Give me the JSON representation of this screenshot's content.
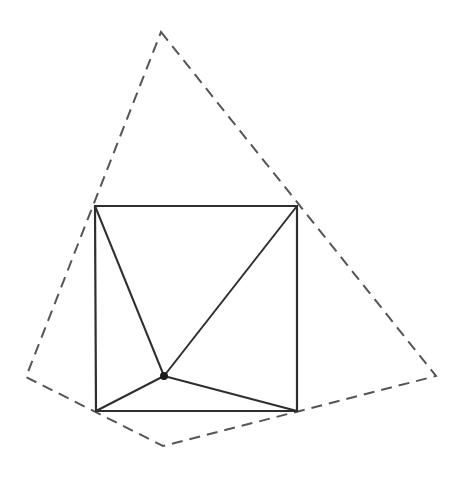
{
  "diagram": {
    "colors": {
      "background": "#ffffff",
      "solid_stroke": "#2e2e2e",
      "dashed_stroke": "#555555",
      "point_fill": "#1a1a1a"
    },
    "square": {
      "vertices": [
        {
          "name": "top-left",
          "x": 95,
          "y": 206
        },
        {
          "name": "top-right",
          "x": 297,
          "y": 206
        },
        {
          "name": "bottom-right",
          "x": 297,
          "y": 411
        },
        {
          "name": "bottom-left",
          "x": 96,
          "y": 411
        }
      ]
    },
    "interior_point": {
      "x": 164,
      "y": 376,
      "r": 4
    },
    "connectors": [
      {
        "from": "interior",
        "to": "top-left"
      },
      {
        "from": "interior",
        "to": "top-right"
      },
      {
        "from": "interior",
        "to": "bottom-right"
      },
      {
        "from": "interior",
        "to": "bottom-left"
      }
    ],
    "dashed_polygon": {
      "vertices": [
        {
          "name": "top",
          "x": 161,
          "y": 32
        },
        {
          "name": "right",
          "x": 436,
          "y": 376
        },
        {
          "name": "bottom",
          "x": 163,
          "y": 446
        },
        {
          "name": "left",
          "x": 26,
          "y": 377
        }
      ],
      "dash": "11 7"
    }
  }
}
